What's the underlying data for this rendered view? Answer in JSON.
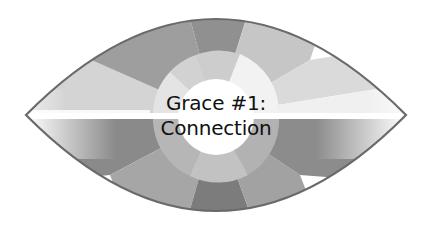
{
  "diagram": {
    "shape": "eye",
    "title_line1": "Grace #1:",
    "title_line2": "Connection",
    "colors": {
      "outline": "#6a6a6a",
      "text": "#111111",
      "center": "#ffffff",
      "band": "#ffffff"
    },
    "outer_segments_top": [
      "#d2d2d2",
      "#9c9c9c",
      "#8f8f8f",
      "#c4c4c4",
      "#dcdcdc",
      "#f2f2f2"
    ],
    "outer_segments_bottom": [
      "#8a8a8a",
      "#a8a8a8",
      "#7a7a7a",
      "#a4a4a4",
      "#8c8c8c"
    ],
    "middle_ring": [
      "#e6e6e6",
      "#cfcfcf",
      "#f4f4f4",
      "#c0c0c0",
      "#b0b0b0",
      "#d8d8d8"
    ]
  }
}
